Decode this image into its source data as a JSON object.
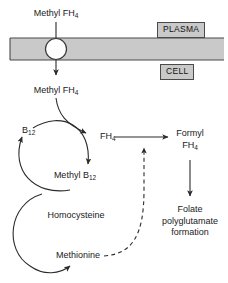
{
  "diagram": {
    "colors": {
      "membrane_fill": "#c9c9c9",
      "membrane_edge": "#4a4a4a",
      "stroke": "#2b2b2b",
      "text": "#1a1a1a",
      "box_fill": "#c9c9c9",
      "background": "#ffffff"
    },
    "compartments": [
      {
        "name": "plasma-label",
        "text": "PLASMA"
      },
      {
        "name": "cell-label",
        "text": "CELL"
      }
    ],
    "labels": {
      "methyl_fh4_plasma": {
        "main": "Methyl FH",
        "sub": "4"
      },
      "methyl_fh4_cell": {
        "main": "Methyl FH",
        "sub": "4"
      },
      "b12": {
        "main": "B",
        "sub": "12"
      },
      "methyl_b12": {
        "main": "Methyl B",
        "sub": "12"
      },
      "fh4": {
        "main": "FH",
        "sub": "4"
      },
      "formyl_line1": "Formyl",
      "formyl_line2": {
        "main": "FH",
        "sub": "4"
      },
      "homocysteine": "Homocysteine",
      "methionine": "Methionine",
      "folate_line1": "Folate",
      "folate_line2": "polyglutamate",
      "folate_line3": "formation"
    },
    "arrows": [
      {
        "name": "transport-arrow",
        "style": "solid",
        "from": "Methyl FH4 (plasma)",
        "to": "Methyl FH4 (cell)"
      },
      {
        "name": "methyl-fh4-to-fh4-arrow",
        "style": "solid",
        "from": "Methyl FH4 (cell)",
        "to": "FH4"
      },
      {
        "name": "b12-methylation-arc",
        "style": "solid",
        "from": "B12",
        "to": "Methyl B12"
      },
      {
        "name": "methyl-b12-to-b12-arc",
        "style": "solid",
        "from": "Methyl B12",
        "to": "B12"
      },
      {
        "name": "homocysteine-to-methionine-arc",
        "style": "solid",
        "from": "Homocysteine",
        "to": "Methionine"
      },
      {
        "name": "fh4-to-formyl-arrow",
        "style": "solid",
        "from": "FH4",
        "to": "Formyl FH4"
      },
      {
        "name": "formyl-to-folate-arrow",
        "style": "solid",
        "from": "Formyl FH4",
        "to": "Folate polyglutamate formation"
      },
      {
        "name": "methionine-feedback-arrow",
        "style": "dashed",
        "from": "Methionine",
        "to": "FH4 to Formyl FH4 step"
      }
    ]
  }
}
